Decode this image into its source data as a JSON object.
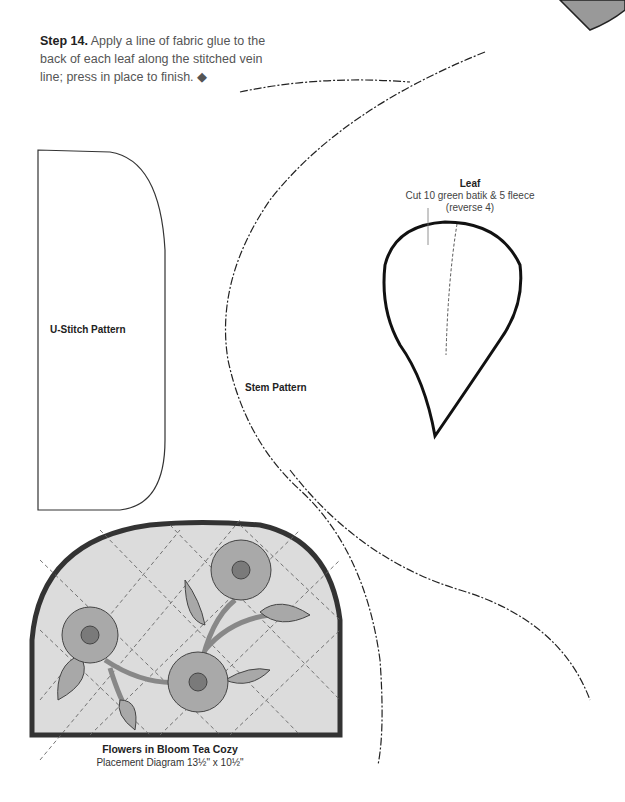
{
  "step": {
    "label": "Step 14.",
    "text": " Apply a line of fabric glue to the back of each leaf along the stitched vein line; press in place to finish. ◆"
  },
  "patterns": {
    "u_stitch": {
      "label": "U-Stitch Pattern"
    },
    "stem": {
      "label": "Stem Pattern"
    },
    "leaf": {
      "title": "Leaf",
      "line1": "Cut 10 green batik & 5 fleece",
      "line2": "(reverse 4)"
    }
  },
  "diagram": {
    "title": "Flowers in Bloom Tea Cozy",
    "subtitle": "Placement Diagram 13½\" x 10½\""
  },
  "colors": {
    "outline": "#222222",
    "cozy_fill": "#dcdcdc",
    "petal": "#a9a9a9",
    "center": "#7a7a7a",
    "leaf_fill": "#9e9e9e"
  }
}
